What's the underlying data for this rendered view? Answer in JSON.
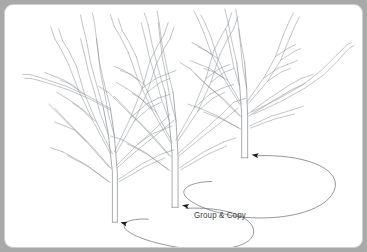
{
  "scene": {
    "title": "Group & Copy",
    "background_color": "#a9a9a9",
    "panel_color": "#ffffff",
    "panel_border_color": "#cfcfcf",
    "line_color": "#8e9398",
    "trunk_line_color": "#7d8287",
    "arrow_color": "#6f7479",
    "arrowhead_color": "#1a1a1a",
    "label_color": "#3b3b3b"
  },
  "annotation": {
    "label": "Group & Copy",
    "x": 189,
    "y": 205
  },
  "trees": [
    {
      "name": "tree-left",
      "trunk_base_x": 112,
      "trunk_base_y": 222,
      "height": 200
    },
    {
      "name": "tree-center",
      "trunk_base_x": 172,
      "trunk_base_y": 206,
      "height": 205
    },
    {
      "name": "tree-right",
      "trunk_base_x": 243,
      "trunk_base_y": 156,
      "height": 150
    }
  ],
  "arrows": [
    {
      "name": "arrow-right-to-center",
      "from": "tree-right-base",
      "to": "tree-center-base",
      "head_x": 246,
      "head_y": 155
    },
    {
      "name": "arrow-center-to-left",
      "from": "tree-center-base",
      "to": "tree-left-base",
      "head_x": 176,
      "head_y": 206
    },
    {
      "name": "arrow-loop-left",
      "from": "loop",
      "to": "tree-left-base",
      "head_x": 115,
      "head_y": 222
    }
  ]
}
